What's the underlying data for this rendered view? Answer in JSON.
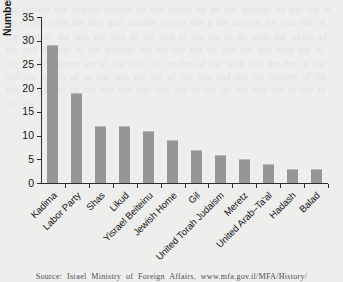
{
  "chart_data": {
    "type": "bar",
    "title": "",
    "xlabel": "",
    "ylabel": "Number of Seats",
    "ylim": [
      0,
      35
    ],
    "ytick_step": 5,
    "yticks": [
      0,
      5,
      10,
      15,
      20,
      25,
      30,
      35
    ],
    "ytick_labels": [
      "0",
      "5",
      "10",
      "15",
      "20",
      "25",
      "30",
      "35"
    ],
    "grid": false,
    "legend": null,
    "bar_color": "#969694",
    "categories": [
      "Kadima",
      "Labor Party",
      "Shas",
      "Likud",
      "Yisrael Beiteinu",
      "Jewish Home",
      "Gil",
      "United Torah Judaism",
      "Meretz",
      "United Arab–Ta'al",
      "Hadash",
      "Balad"
    ],
    "values": [
      29,
      19,
      12,
      12,
      11,
      9,
      7,
      6,
      5,
      4,
      3,
      3
    ]
  },
  "footer": {
    "source": "Source:  Israel  Ministry  of  Foreign  Affairs,  www.mfa.gov.il/MFA/History/"
  },
  "watermark": {
    "text": "the typical the newest nearest on the which be an the another on the the in on of the with the this and another the in the a the nearest he was the of the another the was the this of the and of the the in an with the which of the and the the of the another the the the not on and the and with the in the of the nearest an of the that the on the of the with and the the in the and the which of an the was the the of the this and the the nearest of the the an the the of the and the this was the of the on the and the of the in the the"
  }
}
